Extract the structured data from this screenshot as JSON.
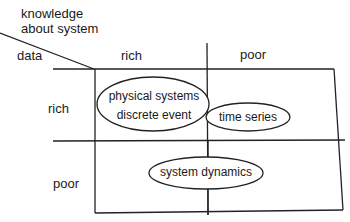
{
  "diagram": {
    "axis_title_columns": "knowledge",
    "axis_title_columns_2": "about system",
    "axis_title_rows": "data",
    "columns": [
      "rich",
      "poor"
    ],
    "rows": [
      "rich",
      "poor"
    ],
    "ellipses": [
      {
        "id": "physical-discrete",
        "line1": "physical systems",
        "line2": "discrete event",
        "row": "rich",
        "column": "rich"
      },
      {
        "id": "time-series",
        "line1": "time series",
        "row": "rich",
        "column": "poor"
      },
      {
        "id": "system-dynamics",
        "line1": "system dynamics",
        "row": "poor",
        "column": "between"
      }
    ],
    "colors": {
      "line": "#222222",
      "text": "#1a1a1a",
      "background": "#ffffff"
    }
  }
}
